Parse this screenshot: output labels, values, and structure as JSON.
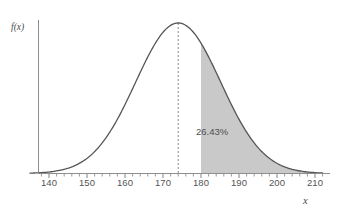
{
  "chart_data": {
    "type": "area",
    "title": "",
    "xlabel": "x",
    "ylabel": "f(x)",
    "xlim": [
      135,
      212
    ],
    "ylim": [
      0,
      1.08
    ],
    "grid": false,
    "legend": null,
    "distribution": {
      "kind": "normal",
      "mean": 174,
      "stddev": 11.2,
      "peak_x": 174
    },
    "xticks": [
      140,
      150,
      160,
      170,
      180,
      190,
      200,
      210
    ],
    "xtick_labels": [
      "140",
      "150",
      "160",
      "170",
      "180",
      "190",
      "200",
      "210"
    ],
    "minor_tick_step": 2,
    "yticks": [],
    "ytick_labels": [],
    "annotations": [
      {
        "name": "shaded-area-percent",
        "text": "26.43%",
        "x": 187,
        "y": 0.3
      }
    ],
    "shaded_regions": [
      {
        "name": "right-tail-shaded-region",
        "from": 180,
        "to": 212,
        "fill": "#c9c9c9",
        "label": "26.43%"
      }
    ],
    "reference_lines": [
      {
        "name": "mean-dashed-line",
        "orientation": "vertical",
        "x": 174,
        "style": "dashed",
        "color": "#8c8c8c"
      }
    ],
    "curve_color": "#555555",
    "axis_color": "#8e8e8e",
    "background": "#ffffff"
  },
  "labels": {
    "ylabel": "f(x)",
    "xlabel": "x",
    "area_percent": "26.43%",
    "xticks": {
      "t140": "140",
      "t150": "150",
      "t160": "160",
      "t170": "170",
      "t180": "180",
      "t190": "190",
      "t200": "200",
      "t210": "210"
    }
  },
  "colors": {
    "shade": "#c9c9c9",
    "curve": "#555555",
    "axis": "#8e8e8e",
    "dashed": "#8c8c8c",
    "text": "#4f4f4f"
  }
}
